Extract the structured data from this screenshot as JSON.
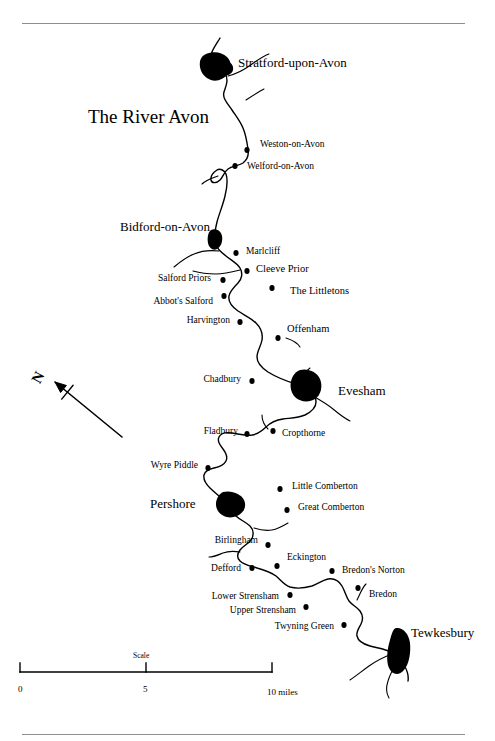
{
  "figure": {
    "title": "The River Avon",
    "title_x": 88,
    "title_y": 107,
    "page_width": 495,
    "page_height": 741,
    "ink_color": "#000000",
    "rule_color": "#8e8e8e"
  },
  "compass": {
    "label": "N",
    "label_x": 33,
    "label_y": 370,
    "arrow_tail_x": 122,
    "arrow_tail_y": 437,
    "arrow_head_x": 55,
    "arrow_head_y": 382
  },
  "scale_bar": {
    "caption": "Scale",
    "caption_x": 133,
    "caption_y": 652,
    "left_x": 20,
    "mid_x": 146,
    "right_x": 272,
    "bar_y": 672,
    "tick_height": 9,
    "ticks": [
      {
        "label": "0",
        "x": 18,
        "y": 685
      },
      {
        "label": "5",
        "x": 143,
        "y": 685
      },
      {
        "label": "10 miles",
        "x": 267,
        "y": 688
      }
    ]
  },
  "major_towns": [
    {
      "name": "Stratford-upon-Avon",
      "label_x": 238,
      "label_y": 56,
      "blob_x": 214,
      "blob_y": 66
    },
    {
      "name": "Bidford-on-Avon",
      "label_x": 120,
      "label_y": 220,
      "blob_x": 215,
      "blob_y": 238
    },
    {
      "name": "Evesham",
      "label_x": 338,
      "label_y": 384,
      "blob_x": 307,
      "blob_y": 385
    },
    {
      "name": "Pershore",
      "label_x": 150,
      "label_y": 497,
      "blob_x": 231,
      "blob_y": 502
    },
    {
      "name": "Tewkesbury",
      "label_x": 411,
      "label_y": 626,
      "blob_x": 398,
      "blob_y": 646
    }
  ],
  "villages": [
    {
      "name": "Weston-on-Avon",
      "dot_x": 247,
      "dot_y": 150,
      "label_x": 260,
      "label_y": 140,
      "align": "left"
    },
    {
      "name": "Welford-on-Avon",
      "dot_x": 235,
      "dot_y": 166,
      "label_x": 247,
      "label_y": 162,
      "align": "left"
    },
    {
      "name": "Marlcliff",
      "dot_x": 236,
      "dot_y": 253,
      "label_x": 246,
      "label_y": 247,
      "align": "left"
    },
    {
      "name": "Cleeve Prior",
      "dot_x": 247,
      "dot_y": 271,
      "label_x": 256,
      "label_y": 264,
      "align": "left"
    },
    {
      "name": "Salford Priors",
      "dot_x": 223,
      "dot_y": 280,
      "label_x": 211,
      "label_y": 274,
      "align": "right"
    },
    {
      "name": "The Littletons",
      "dot_x": 272,
      "dot_y": 288,
      "label_x": 290,
      "label_y": 286,
      "align": "left"
    },
    {
      "name": "Abbot's Salford",
      "dot_x": 224,
      "dot_y": 296,
      "label_x": 213,
      "label_y": 297,
      "align": "right"
    },
    {
      "name": "Harvington",
      "dot_x": 240,
      "dot_y": 322,
      "label_x": 230,
      "label_y": 316,
      "align": "right"
    },
    {
      "name": "Offenham",
      "dot_x": 278,
      "dot_y": 338,
      "label_x": 287,
      "label_y": 324,
      "align": "left"
    },
    {
      "name": "Chadbury",
      "dot_x": 252,
      "dot_y": 381,
      "label_x": 241,
      "label_y": 375,
      "align": "right"
    },
    {
      "name": "Fladbury",
      "dot_x": 247,
      "dot_y": 434,
      "label_x": 238,
      "label_y": 427,
      "align": "right"
    },
    {
      "name": "Cropthorne",
      "dot_x": 273,
      "dot_y": 431,
      "label_x": 282,
      "label_y": 429,
      "align": "left"
    },
    {
      "name": "Wyre Piddle",
      "dot_x": 208,
      "dot_y": 468,
      "label_x": 198,
      "label_y": 461,
      "align": "right"
    },
    {
      "name": "Little Comberton",
      "dot_x": 280,
      "dot_y": 489,
      "label_x": 292,
      "label_y": 482,
      "align": "left"
    },
    {
      "name": "Great Comberton",
      "dot_x": 287,
      "dot_y": 510,
      "label_x": 298,
      "label_y": 503,
      "align": "left"
    },
    {
      "name": "Birlingham",
      "dot_x": 268,
      "dot_y": 545,
      "label_x": 258,
      "label_y": 536,
      "align": "right"
    },
    {
      "name": "Eckington",
      "dot_x": 277,
      "dot_y": 566,
      "label_x": 287,
      "label_y": 553,
      "align": "left"
    },
    {
      "name": "Defford",
      "dot_x": 252,
      "dot_y": 568,
      "label_x": 241,
      "label_y": 564,
      "align": "right"
    },
    {
      "name": "Bredon's Norton",
      "dot_x": 332,
      "dot_y": 571,
      "label_x": 342,
      "label_y": 566,
      "align": "left"
    },
    {
      "name": "Bredon",
      "dot_x": 358,
      "dot_y": 588,
      "label_x": 369,
      "label_y": 590,
      "align": "left"
    },
    {
      "name": "Lower Strensham",
      "dot_x": 290,
      "dot_y": 595,
      "label_x": 279,
      "label_y": 592,
      "align": "right"
    },
    {
      "name": "Upper Strensham",
      "dot_x": 306,
      "dot_y": 607,
      "label_x": 296,
      "label_y": 606,
      "align": "right"
    },
    {
      "name": "Twyning Green",
      "dot_x": 344,
      "dot_y": 625,
      "label_x": 334,
      "label_y": 622,
      "align": "right"
    }
  ],
  "river": {
    "name": "River Avon",
    "main_channel_d": "M 220 38 C 214 48, 209 54, 212 60 C 215 66, 222 68, 225 73 C 229 80, 226 86, 224 92 C 222 98, 228 104, 232 110 C 236 116, 240 121, 243 128 C 246 135, 247 142, 248 149 C 249 155, 247 160, 243 163 C 238 166, 232 166, 228 169 C 224 172, 223 177, 220 180 C 217 183, 212 184, 211 180 C 210 175, 214 172, 217 170 C 220 168, 224 170, 226 174 C 228 180, 227 188, 225 196 C 223 205, 219 214, 217 222 C 215 230, 214 236, 215 242 C 216 248, 221 252, 226 256 C 231 260, 237 263, 240 268 C 243 273, 242 279, 238 283 C 234 287, 230 291, 229 296 C 228 302, 232 307, 238 311 C 244 315, 251 318, 256 323 C 261 328, 263 334, 262 340 C 261 346, 257 351, 257 357 C 257 363, 262 368, 268 372 C 276 377, 286 381, 296 384 C 301 386, 305 387, 309 390 C 313 393, 316 397, 316 402 C 316 408, 311 412, 305 415 C 298 418, 290 418, 283 419 C 276 420, 270 423, 266 427 C 262 431, 258 434, 252 435 C 245 436, 238 434, 232 433 C 226 432, 221 433, 219 437 C 217 441, 220 445, 223 449 C 226 453, 228 457, 226 461 C 224 465, 219 467, 214 468 C 209 469, 205 471, 204 475 C 203 480, 206 484, 210 488 C 215 493, 221 497, 225 502 C 229 507, 232 512, 236 516 C 240 520, 246 522, 250 526 C 254 530, 254 536, 251 540 C 248 544, 243 546, 240 550 C 237 554, 237 558, 240 561 C 244 565, 251 566, 257 568 C 264 570, 271 572, 276 576 C 281 580, 284 585, 290 587 C 297 589, 305 588, 312 586 C 318 584, 323 580, 328 579 C 334 578, 339 581, 342 586 C 345 591, 346 597, 349 601 C 352 605, 357 607, 360 611 C 363 615, 363 620, 361 624 C 359 628, 356 632, 357 636 C 358 641, 363 644, 370 646 C 377 648, 385 649, 391 652 C 397 655, 401 660, 404 665 C 407 670, 409 675, 408 681",
    "tributaries_d": [
      "M 228 76 C 236 74, 244 70, 252 64 C 258 60, 263 56, 269 54",
      "M 246 100 C 252 96, 258 92, 264 89",
      "M 218 176 C 212 178, 206 180, 202 184",
      "M 219 251 C 210 250, 201 251, 194 254 C 186 257, 180 262, 174 267",
      "M 240 270 C 232 272, 224 274, 216 274 C 208 274, 200 273, 193 271",
      "M 286 338 C 292 340, 297 342, 300 347",
      "M 296 384 C 300 378, 305 372, 310 368",
      "M 313 396 C 320 400, 327 404, 333 409 C 339 414, 344 418, 350 421",
      "M 268 429 C 264 425, 262 420, 262 415",
      "M 254 528 C 260 530, 266 531, 272 530 C 278 529, 283 526, 288 523",
      "M 240 552 C 234 551, 228 551, 223 553 C 218 555, 214 557, 209 557",
      "M 357 600 C 360 594, 362 588, 366 584",
      "M 392 654 C 384 657, 376 661, 369 666 C 362 671, 356 676, 350 680",
      "M 398 660 C 394 667, 390 674, 388 681 C 386 687, 386 693, 389 698"
    ],
    "town_blobs": [
      {
        "name": "Stratford-upon-Avon",
        "d": "M 206 54 C 213 51, 222 52, 227 57 C 232 62, 232 69, 228 74 C 224 79, 217 82, 211 80 C 205 78, 201 73, 200 67 C 199 61, 201 56, 206 54 Z M 226 60 C 231 62, 234 66, 233 70 C 232 74, 228 76, 224 75 C 220 74, 219 69, 221 65 Z"
      },
      {
        "name": "Bidford-on-Avon",
        "d": "M 211 230 C 216 228, 221 231, 222 236 C 223 241, 221 247, 217 249 C 213 251, 209 248, 208 243 C 207 238, 208 232, 211 230 Z"
      },
      {
        "name": "Evesham",
        "d": "M 300 370 C 308 368, 317 372, 320 379 C 323 386, 321 395, 315 399 C 309 403, 300 402, 295 397 C 290 392, 289 383, 293 376 C 295 373, 297 371, 300 370 Z"
      },
      {
        "name": "Pershore",
        "d": "M 223 492 C 232 490, 241 494, 244 500 C 247 506, 244 513, 237 516 C 230 519, 222 517, 218 511 C 214 505, 216 496, 223 492 Z"
      },
      {
        "name": "Tewkesbury",
        "d": "M 396 628 C 403 627, 409 634, 410 643 C 411 653, 409 664, 404 670 C 399 676, 392 675, 389 668 C 386 661, 387 650, 390 640 C 392 633, 393 629, 396 628 Z"
      }
    ]
  }
}
